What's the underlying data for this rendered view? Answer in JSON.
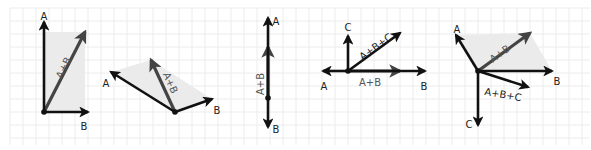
{
  "diagram": {
    "title": "",
    "colors": {
      "background": "#ffffff",
      "grid": "#ececec",
      "vector": "#111111",
      "resultant": "#444444",
      "parallelogram_fill": "#ebebeb"
    },
    "grid": {
      "spacing": 13,
      "x0": 10,
      "x1": 590,
      "y0": 8,
      "y1": 145
    },
    "panels": [
      {
        "id": "panel-1",
        "origin": [
          44,
          112
        ],
        "vectors": [
          {
            "name": "A",
            "label": "A",
            "to": [
              44,
              22
            ],
            "role": "operand",
            "label_pos": [
              44,
              17
            ]
          },
          {
            "name": "B",
            "label": "B",
            "to": [
              88,
              112
            ],
            "role": "operand",
            "label_pos": [
              84,
              127
            ]
          },
          {
            "name": "A+B",
            "label": "A+B",
            "to": [
              85,
              32
            ],
            "role": "resultant",
            "label_pos": [
              64,
              68
            ],
            "label_rot": -64
          }
        ],
        "parallelogram": [
          [
            44,
            112
          ],
          [
            44,
            32
          ],
          [
            85,
            32
          ],
          [
            85,
            112
          ]
        ]
      },
      {
        "id": "panel-2",
        "origin": [
          175,
          112
        ],
        "vectors": [
          {
            "name": "A",
            "label": "A",
            "to": [
              111,
              72
            ],
            "role": "operand",
            "label_pos": [
              106,
              84
            ]
          },
          {
            "name": "B",
            "label": "B",
            "to": [
              212,
              99
            ],
            "role": "operand",
            "label_pos": [
              217,
              111
            ]
          },
          {
            "name": "A+B",
            "label": "A+B",
            "to": [
              151,
              60
            ],
            "role": "resultant",
            "label_pos": [
              170,
              83
            ],
            "label_rot": 66
          }
        ],
        "parallelogram": [
          [
            175,
            112
          ],
          [
            111,
            72
          ],
          [
            151,
            60
          ],
          [
            212,
            99
          ]
        ]
      },
      {
        "id": "panel-3",
        "origin": [
          268,
          98
        ],
        "vectors": [
          {
            "name": "A",
            "label": "A",
            "to": [
              268,
              18
            ],
            "role": "operand",
            "label_pos": [
              276,
              22
            ]
          },
          {
            "name": "B",
            "label": "B",
            "to": [
              268,
              127
            ],
            "role": "operand",
            "label_pos": [
              276,
              130
            ]
          },
          {
            "name": "A+B",
            "label": "A+B",
            "to": [
              268,
              47
            ],
            "role": "resultant",
            "label_pos": [
              261,
              84
            ],
            "label_rot": -90
          }
        ]
      },
      {
        "id": "panel-4",
        "origin": [
          348,
          71
        ],
        "vectors": [
          {
            "name": "A",
            "label": "A",
            "to": [
              323,
              71
            ],
            "role": "operand",
            "label_pos": [
              324,
              87
            ]
          },
          {
            "name": "B",
            "label": "B",
            "to": [
              425,
              71
            ],
            "role": "operand",
            "label_pos": [
              424,
              87
            ]
          },
          {
            "name": "C",
            "label": "C",
            "to": [
              348,
              36
            ],
            "role": "operand",
            "label_pos": [
              348,
              28
            ]
          },
          {
            "name": "A+B",
            "label": "A+B",
            "to": [
              400,
              71
            ],
            "role": "resultant",
            "label_pos": [
              370,
              83
            ]
          },
          {
            "name": "A+B+C",
            "label": "A+B+C",
            "to": [
              400,
              33
            ],
            "role": "resultant-dark",
            "label_pos": [
              376,
              47
            ],
            "label_rot": -36
          }
        ]
      },
      {
        "id": "panel-5",
        "origin": [
          478,
          71
        ],
        "vectors": [
          {
            "name": "A",
            "label": "A",
            "to": [
              456,
              35
            ],
            "role": "operand",
            "label_pos": [
              457,
              30
            ]
          },
          {
            "name": "B",
            "label": "B",
            "to": [
              552,
              71
            ],
            "role": "operand",
            "label_pos": [
              557,
              82
            ]
          },
          {
            "name": "C",
            "label": "C",
            "to": [
              478,
              125
            ],
            "role": "operand",
            "label_pos": [
              469,
              125
            ]
          },
          {
            "name": "A+B",
            "label": "A+B",
            "to": [
              530,
              33
            ],
            "role": "resultant",
            "label_pos": [
              500,
              54
            ],
            "label_rot": -36
          },
          {
            "name": "A+B+C",
            "label": "A+B+C",
            "to": [
              528,
              87
            ],
            "role": "resultant-dark",
            "label_pos": [
              503,
              95
            ],
            "label_rot": 10
          }
        ],
        "parallelogram": [
          [
            478,
            71
          ],
          [
            456,
            35
          ],
          [
            530,
            33
          ],
          [
            552,
            71
          ]
        ]
      }
    ]
  }
}
